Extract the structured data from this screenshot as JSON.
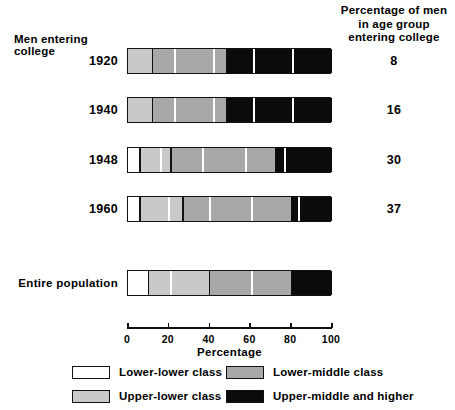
{
  "header": {
    "left_title": "Men entering college",
    "right_title_lines": [
      "Percentage of men",
      "in age group",
      "entering college"
    ]
  },
  "axis": {
    "title": "Percentage",
    "ticks": [
      0,
      20,
      40,
      60,
      80,
      100
    ],
    "min": 0,
    "max": 100
  },
  "legend": {
    "items": [
      {
        "label": "Lower-lower class",
        "key": "lower-lower",
        "color": "#ffffff"
      },
      {
        "label": "Lower-middle class",
        "key": "lower-middle",
        "color": "#a8a8a8"
      },
      {
        "label": "Upper-lower class",
        "key": "upper-lower",
        "color": "#c9c9c9"
      },
      {
        "label": "Upper-middle and higher",
        "key": "upper-middle",
        "color": "#0b0b0b"
      }
    ]
  },
  "rows": [
    {
      "label": "1920",
      "value": "8"
    },
    {
      "label": "1940",
      "value": "16"
    },
    {
      "label": "1948",
      "value": "30"
    },
    {
      "label": "1960",
      "value": "37"
    },
    {
      "label": "Entire population",
      "value": ""
    }
  ],
  "chart_data": {
    "type": "bar",
    "orientation": "horizontal",
    "stacked": true,
    "title": "Men entering college",
    "xlabel": "Percentage",
    "ylabel": "",
    "xlim": [
      0,
      100
    ],
    "xticks": [
      0,
      20,
      40,
      60,
      80,
      100
    ],
    "grid": false,
    "legend_position": "bottom",
    "categories": [
      "1920",
      "1940",
      "1948",
      "1960",
      "Entire population"
    ],
    "series": [
      {
        "name": "Lower-lower class",
        "color": "#ffffff",
        "values": [
          0,
          0,
          6,
          6,
          10
        ]
      },
      {
        "name": "Upper-lower class",
        "color": "#c9c9c9",
        "values": [
          12,
          12,
          15,
          21,
          30
        ]
      },
      {
        "name": "Lower-middle class",
        "color": "#a8a8a8",
        "values": [
          36,
          36,
          51,
          53,
          40
        ]
      },
      {
        "name": "Upper-middle and higher",
        "color": "#0b0b0b",
        "values": [
          52,
          52,
          28,
          20,
          20
        ]
      }
    ],
    "cumulative_boundaries": {
      "1920": [
        0,
        0,
        12,
        48,
        100
      ],
      "1940": [
        0,
        0,
        12,
        48,
        100
      ],
      "1948": [
        0,
        6,
        21,
        72,
        100
      ],
      "1960": [
        0,
        6,
        27,
        80,
        100
      ],
      "Entire population": [
        0,
        10,
        40,
        80,
        100
      ]
    },
    "annotations": {
      "right_column_title": "Percentage of men in age group entering college",
      "right_column_values": {
        "1920": 8,
        "1940": 16,
        "1948": 30,
        "1960": 37
      }
    }
  },
  "bar_layout": [
    {
      "row": 0,
      "top": 48,
      "segments": [
        {
          "cls": "c-ul",
          "x0": 0,
          "x1": 12
        },
        {
          "cls": "c-lm",
          "x0": 12,
          "x1": 48
        },
        {
          "cls": "c-um",
          "x0": 48,
          "x1": 100
        }
      ],
      "dividers": [
        {
          "at": 12,
          "style": "dark"
        },
        {
          "at": 23,
          "style": "light"
        },
        {
          "at": 42,
          "style": "light"
        },
        {
          "at": 62,
          "style": "light"
        },
        {
          "at": 81,
          "style": "light"
        }
      ]
    },
    {
      "row": 1,
      "top": 97,
      "segments": [
        {
          "cls": "c-ul",
          "x0": 0,
          "x1": 12
        },
        {
          "cls": "c-lm",
          "x0": 12,
          "x1": 48
        },
        {
          "cls": "c-um",
          "x0": 48,
          "x1": 100
        }
      ],
      "dividers": [
        {
          "at": 12,
          "style": "dark"
        },
        {
          "at": 23,
          "style": "light"
        },
        {
          "at": 42,
          "style": "light"
        },
        {
          "at": 62,
          "style": "light"
        },
        {
          "at": 81,
          "style": "light"
        }
      ]
    },
    {
      "row": 2,
      "top": 147,
      "segments": [
        {
          "cls": "c-ll",
          "x0": 0,
          "x1": 6
        },
        {
          "cls": "c-ul",
          "x0": 6,
          "x1": 21
        },
        {
          "cls": "c-lm",
          "x0": 21,
          "x1": 72
        },
        {
          "cls": "c-um",
          "x0": 72,
          "x1": 100
        }
      ],
      "dividers": [
        {
          "at": 6,
          "style": "dark"
        },
        {
          "at": 16,
          "style": "light"
        },
        {
          "at": 21,
          "style": "dark"
        },
        {
          "at": 37,
          "style": "light"
        },
        {
          "at": 58,
          "style": "light"
        },
        {
          "at": 77,
          "style": "light"
        }
      ]
    },
    {
      "row": 3,
      "top": 196,
      "segments": [
        {
          "cls": "c-ll",
          "x0": 0,
          "x1": 6
        },
        {
          "cls": "c-ul",
          "x0": 6,
          "x1": 27
        },
        {
          "cls": "c-lm",
          "x0": 27,
          "x1": 80
        },
        {
          "cls": "c-um",
          "x0": 80,
          "x1": 100
        }
      ],
      "dividers": [
        {
          "at": 6,
          "style": "dark"
        },
        {
          "at": 20,
          "style": "light"
        },
        {
          "at": 27,
          "style": "dark"
        },
        {
          "at": 40,
          "style": "light"
        },
        {
          "at": 61,
          "style": "light"
        },
        {
          "at": 84,
          "style": "light"
        }
      ]
    },
    {
      "row": 4,
      "top": 270,
      "segments": [
        {
          "cls": "c-ll",
          "x0": 0,
          "x1": 10
        },
        {
          "cls": "c-ul",
          "x0": 10,
          "x1": 40
        },
        {
          "cls": "c-lm",
          "x0": 40,
          "x1": 80
        },
        {
          "cls": "c-um",
          "x0": 80,
          "x1": 100
        }
      ],
      "dividers": [
        {
          "at": 10,
          "style": "dark"
        },
        {
          "at": 21,
          "style": "light"
        },
        {
          "at": 40,
          "style": "dark"
        },
        {
          "at": 61,
          "style": "light"
        }
      ]
    }
  ]
}
